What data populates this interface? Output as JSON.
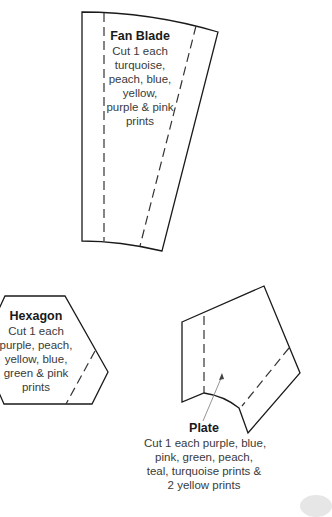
{
  "pieces": {
    "fan_blade": {
      "title": "Fan Blade",
      "lines": [
        "Cut 1 each",
        "turquoise,",
        "peach, blue,",
        "yellow,",
        "purple & pink",
        "prints"
      ]
    },
    "hexagon": {
      "title": "Hexagon",
      "lines": [
        "Cut 1 each",
        "purple, peach,",
        "yellow, blue,",
        "green & pink",
        "prints"
      ]
    },
    "plate": {
      "title": "Plate",
      "lines": [
        "Cut 1 each purple, blue,",
        "pink, green, peach,",
        "teal, turquoise prints &",
        "2 yellow prints"
      ]
    }
  },
  "colors": {
    "outline": "#1a1a1a",
    "text": "#3a3a3a",
    "pointer": "#888888"
  }
}
